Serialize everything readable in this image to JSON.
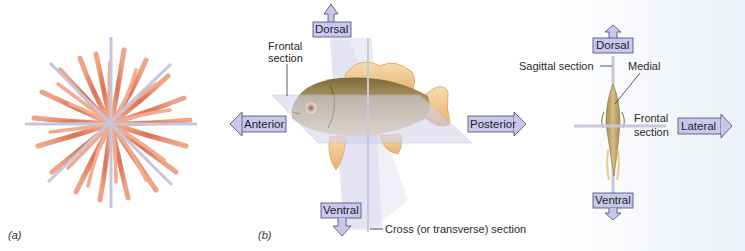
{
  "panels": [
    {
      "id": "a",
      "label": "(a)",
      "subject": "radially symmetric animal (sea anemone-like)",
      "planes": [
        "vertical",
        "horizontal",
        "diagonal-1",
        "diagonal-2"
      ]
    },
    {
      "id": "b",
      "label": "(b)",
      "subject": "bilaterally symmetric fish, lateral view",
      "directions": {
        "dorsal": "Dorsal",
        "ventral": "Ventral",
        "anterior": "Anterior",
        "posterior": "Posterior"
      },
      "annotations": {
        "frontal_section_line1": "Frontal",
        "frontal_section_line2": "section",
        "cross_section": "Cross (or transverse) section"
      }
    },
    {
      "id": "c",
      "subject": "fish, front view",
      "directions": {
        "dorsal": "Dorsal",
        "ventral": "Ventral",
        "lateral": "Lateral"
      },
      "annotations": {
        "sagittal_section": "Sagittal section",
        "medial": "Medial",
        "frontal_section_line1": "Frontal",
        "frontal_section_line2": "section"
      }
    }
  ],
  "colors": {
    "arrow_fill": "#c9c8ea",
    "arrow_stroke": "#4a4870",
    "plane_fill": "#d8d8ee",
    "tentacle": "#e58a6a",
    "fish_body": "#b59a60",
    "fin": "#f0c890"
  }
}
